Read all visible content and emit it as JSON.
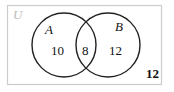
{
  "diagram": {
    "type": "venn",
    "universe_label": "U",
    "sets": [
      {
        "name": "A",
        "only_count": "10"
      },
      {
        "name": "B",
        "only_count": "12"
      }
    ],
    "intersection_count": "8",
    "outside_count": "12",
    "colors": {
      "lines": "#222222",
      "frame": "#cccccc",
      "universe_label": "#bbbbbb"
    }
  }
}
